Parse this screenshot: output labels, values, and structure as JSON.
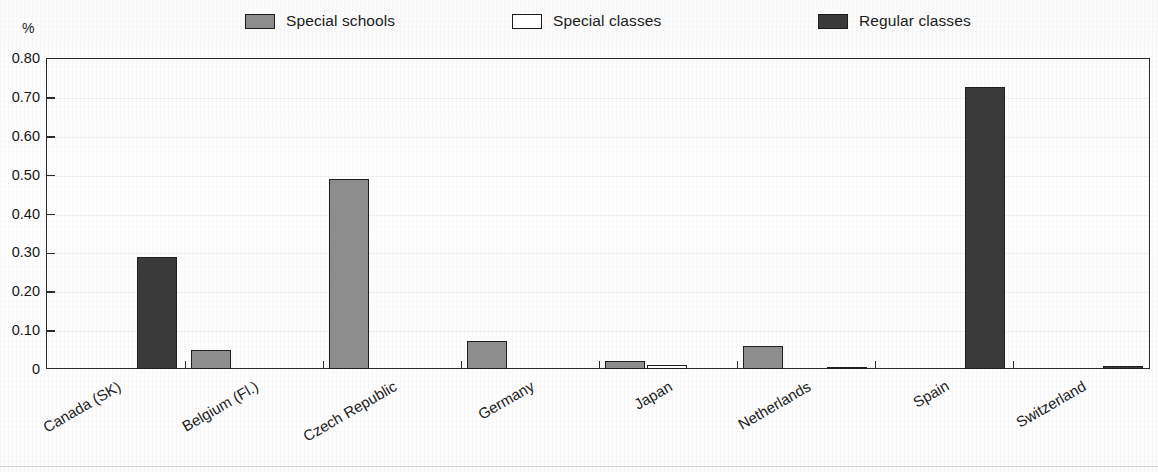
{
  "chart_data": {
    "type": "bar",
    "title": "",
    "subtitle": "",
    "xlabel": "",
    "ylabel": "%",
    "ylim": [
      0,
      0.8
    ],
    "ytick_labels": [
      "0.80",
      "0.70",
      "0.60",
      "0.50",
      "0.40",
      "0.30",
      "0.20",
      "0.10",
      "0"
    ],
    "ytick_values": [
      0.8,
      0.7,
      0.6,
      0.5,
      0.4,
      0.3,
      0.2,
      0.1,
      0
    ],
    "grid": true,
    "legend_position": "top",
    "categories": [
      "Canada (SK)",
      "Belgium (Fl.)",
      "Czech Republic",
      "Germany",
      "Japan",
      "Netherlands",
      "Spain",
      "Switzerland"
    ],
    "series": [
      {
        "name": "Special schools",
        "color": "#8d8d8d",
        "values": [
          0,
          0.048,
          0.49,
          0.072,
          0.021,
          0.058,
          0,
          0
        ]
      },
      {
        "name": "Special classes",
        "color": "#ffffff",
        "values": [
          0,
          0,
          0,
          0,
          0.01,
          0,
          0,
          0
        ]
      },
      {
        "name": "Regular classes",
        "color": "#3a3a3a",
        "values": [
          0.287,
          0,
          0,
          0,
          0,
          0.006,
          0.725,
          0.007
        ]
      }
    ]
  },
  "legend": {
    "items": [
      {
        "label": "Special schools",
        "color": "#8d8d8d"
      },
      {
        "label": "Special classes",
        "color": "#ffffff"
      },
      {
        "label": "Regular classes",
        "color": "#3a3a3a"
      }
    ]
  },
  "axis": {
    "unit_label": "%"
  }
}
